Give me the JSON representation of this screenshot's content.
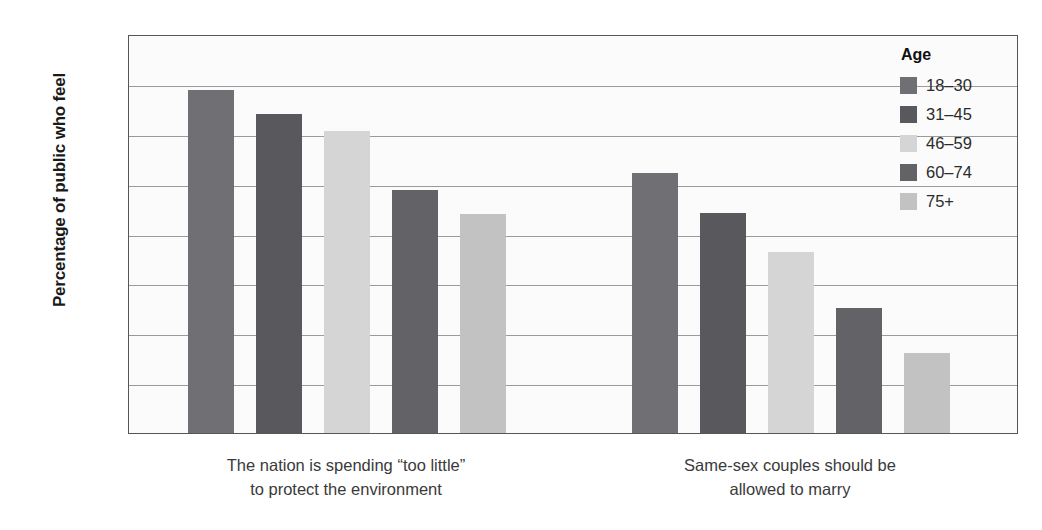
{
  "chart_data": {
    "type": "bar",
    "title": "",
    "xlabel": "",
    "ylabel": "Percentage of public who feel",
    "ylim": [
      0,
      80
    ],
    "yticks": [
      0,
      10,
      20,
      30,
      40,
      50,
      60,
      70,
      80
    ],
    "ytick_labels": [
      "0",
      "10",
      "20",
      "30",
      "40",
      "50",
      "60",
      "70",
      "80"
    ],
    "grid": "horizontal",
    "legend_position": "top-right",
    "legend_title": "Age",
    "categories": [
      "The nation is spending “too little” to protect the environment",
      "Same-sex couples should be allowed to marry"
    ],
    "category_lines": [
      [
        "The nation is spending “too little”",
        "to protect the environment"
      ],
      [
        "Same-sex couples should be",
        "allowed to marry"
      ]
    ],
    "series": [
      {
        "name": "18–30",
        "color": "#706f73",
        "values": [
          68.7,
          52.2
        ]
      },
      {
        "name": "31–45",
        "color": "#59585c",
        "values": [
          64.0,
          44.1
        ]
      },
      {
        "name": "46–59",
        "color": "#d5d5d6",
        "values": [
          60.5,
          36.3
        ]
      },
      {
        "name": "60–74",
        "color": "#636266",
        "values": [
          48.7,
          25.0
        ]
      },
      {
        "name": "75+",
        "color": "#c2c2c3",
        "values": [
          44.0,
          16.0
        ]
      }
    ]
  },
  "legend": {
    "title": "Age",
    "items": [
      {
        "label": "18–30",
        "color": "#706f73"
      },
      {
        "label": "31–45",
        "color": "#59585c"
      },
      {
        "label": "46–59",
        "color": "#d5d5d6"
      },
      {
        "label": "60–74",
        "color": "#636266"
      },
      {
        "label": "75+",
        "color": "#c2c2c3"
      }
    ]
  },
  "axes": {
    "y_title": "Percentage of public who feel",
    "y_tick_labels": [
      "80",
      "70",
      "60",
      "50",
      "40",
      "30",
      "20",
      "10",
      "0"
    ],
    "x_group_labels": [
      {
        "line1": "The nation is spending “too little”",
        "line2": "to protect the environment"
      },
      {
        "line1": "Same-sex couples should be",
        "line2": "allowed to marry"
      }
    ]
  }
}
